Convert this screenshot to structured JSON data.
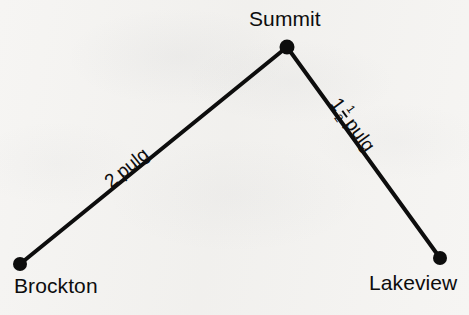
{
  "figure": {
    "type": "path-diagram",
    "background_color": "#f6f5f3",
    "ink_color": "#0d0d0d",
    "width": 469,
    "height": 315
  },
  "nodes": [
    {
      "id": "brockton",
      "label": "Brockton",
      "x": 20,
      "y": 264
    },
    {
      "id": "summit",
      "label": "Summit",
      "x": 287,
      "y": 47
    },
    {
      "id": "lakeview",
      "label": "Lakeview",
      "x": 440,
      "y": 258
    }
  ],
  "segments": [
    {
      "id": "brockton-summit",
      "from": "brockton",
      "to": "summit",
      "measure_text": "2 pulg",
      "value": "2",
      "unit": "pulg",
      "angle_deg": -39.1
    },
    {
      "id": "summit-lakeview",
      "from": "summit",
      "to": "lakeview",
      "measure_text": "1 1/2 pulg",
      "whole": "1",
      "numerator": "1",
      "denominator": "2",
      "unit": "pulg",
      "angle_deg": 54.0
    }
  ],
  "style": {
    "line_width": 4,
    "dot_radius": 7
  }
}
